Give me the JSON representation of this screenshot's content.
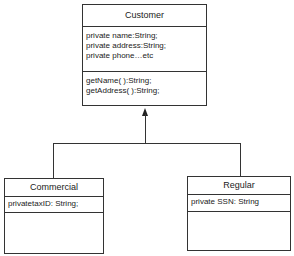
{
  "diagram": {
    "type": "UML class diagram (inheritance)",
    "classes": [
      {
        "name": "Customer",
        "attributes": [
          "private name:String;",
          "private address:String;",
          "private phone…etc"
        ],
        "operations": [
          "getName( ):String;",
          "getAddress( ):String;"
        ]
      },
      {
        "name": "Commercial",
        "attributes": [
          "privatetaxID: String;"
        ],
        "operations": []
      },
      {
        "name": "Regular",
        "attributes": [
          "private SSN: String"
        ],
        "operations": []
      }
    ],
    "relationships": [
      {
        "type": "generalization",
        "from": "Commercial",
        "to": "Customer"
      },
      {
        "type": "generalization",
        "from": "Regular",
        "to": "Customer"
      }
    ]
  }
}
